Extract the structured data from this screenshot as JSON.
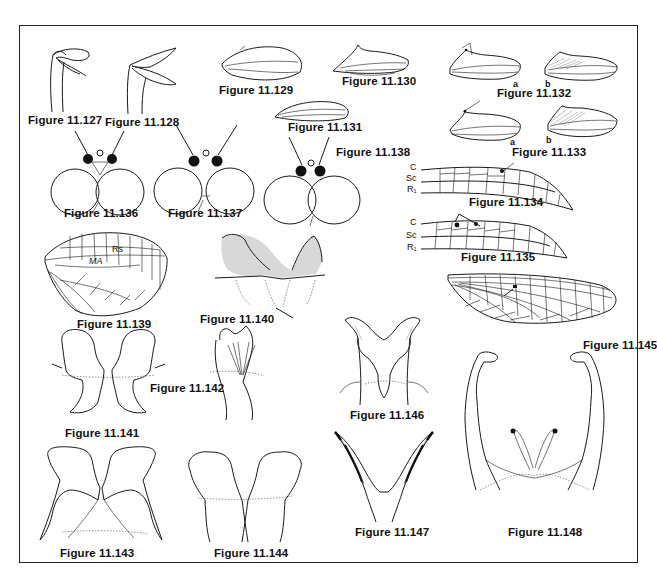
{
  "plate": {
    "figures": [
      {
        "id": "11.127",
        "label": "Figure 11.127",
        "subject": "leg-tarsal-claws"
      },
      {
        "id": "11.128",
        "label": "Figure 11.128",
        "subject": "leg-tarsal-claws"
      },
      {
        "id": "11.129",
        "label": "Figure 11.129",
        "subject": "hind-wing"
      },
      {
        "id": "11.130",
        "label": "Figure 11.130",
        "subject": "hind-wing"
      },
      {
        "id": "11.131",
        "label": "Figure 11.131",
        "subject": "hind-wing"
      },
      {
        "id": "11.132",
        "label": "Figure 11.132",
        "subject": "hind-wing-pair",
        "sub_labels": [
          "a",
          "b"
        ]
      },
      {
        "id": "11.133",
        "label": "Figure 11.133",
        "subject": "hind-wing-pair",
        "sub_labels": [
          "a",
          "b"
        ]
      },
      {
        "id": "11.134",
        "label": "Figure 11.134",
        "subject": "forewing-costal-region",
        "vein_labels": [
          "C",
          "Sc",
          "R1"
        ]
      },
      {
        "id": "11.135",
        "label": "Figure 11.135",
        "subject": "forewing-costal-region",
        "vein_labels": [
          "C",
          "Sc",
          "R1"
        ]
      },
      {
        "id": "11.136",
        "label": "Figure 11.136",
        "subject": "head-compound-eyes"
      },
      {
        "id": "11.137",
        "label": "Figure 11.137",
        "subject": "head-compound-eyes"
      },
      {
        "id": "11.138",
        "label": "Figure 11.138",
        "subject": "head-compound-eyes"
      },
      {
        "id": "11.139",
        "label": "Figure 11.139",
        "subject": "hind-wing-venation",
        "vein_labels": [
          "Rs",
          "MA"
        ]
      },
      {
        "id": "11.140",
        "label": "Figure 11.140",
        "subject": "genitalia-stippled"
      },
      {
        "id": "11.141",
        "label": "Figure 11.141",
        "subject": "genitalia"
      },
      {
        "id": "11.142",
        "label": "Figure 11.142",
        "subject": "genitalia"
      },
      {
        "id": "11.143",
        "label": "Figure 11.143",
        "subject": "genitalia"
      },
      {
        "id": "11.144",
        "label": "Figure 11.144",
        "subject": "genitalia"
      },
      {
        "id": "11.145",
        "label": "Figure 11.145",
        "subject": "forewing-full-venation"
      },
      {
        "id": "11.146",
        "label": "Figure 11.146",
        "subject": "genitalia"
      },
      {
        "id": "11.147",
        "label": "Figure 11.147",
        "subject": "genitalia-penes"
      },
      {
        "id": "11.148",
        "label": "Figure 11.148",
        "subject": "genitalia-forceps"
      }
    ],
    "sub_labels": {
      "a": "a",
      "b": "b"
    },
    "veins": {
      "C": "C",
      "Sc": "Sc",
      "R1": "R₁",
      "Rs": "Rs",
      "MA": "MA"
    }
  }
}
